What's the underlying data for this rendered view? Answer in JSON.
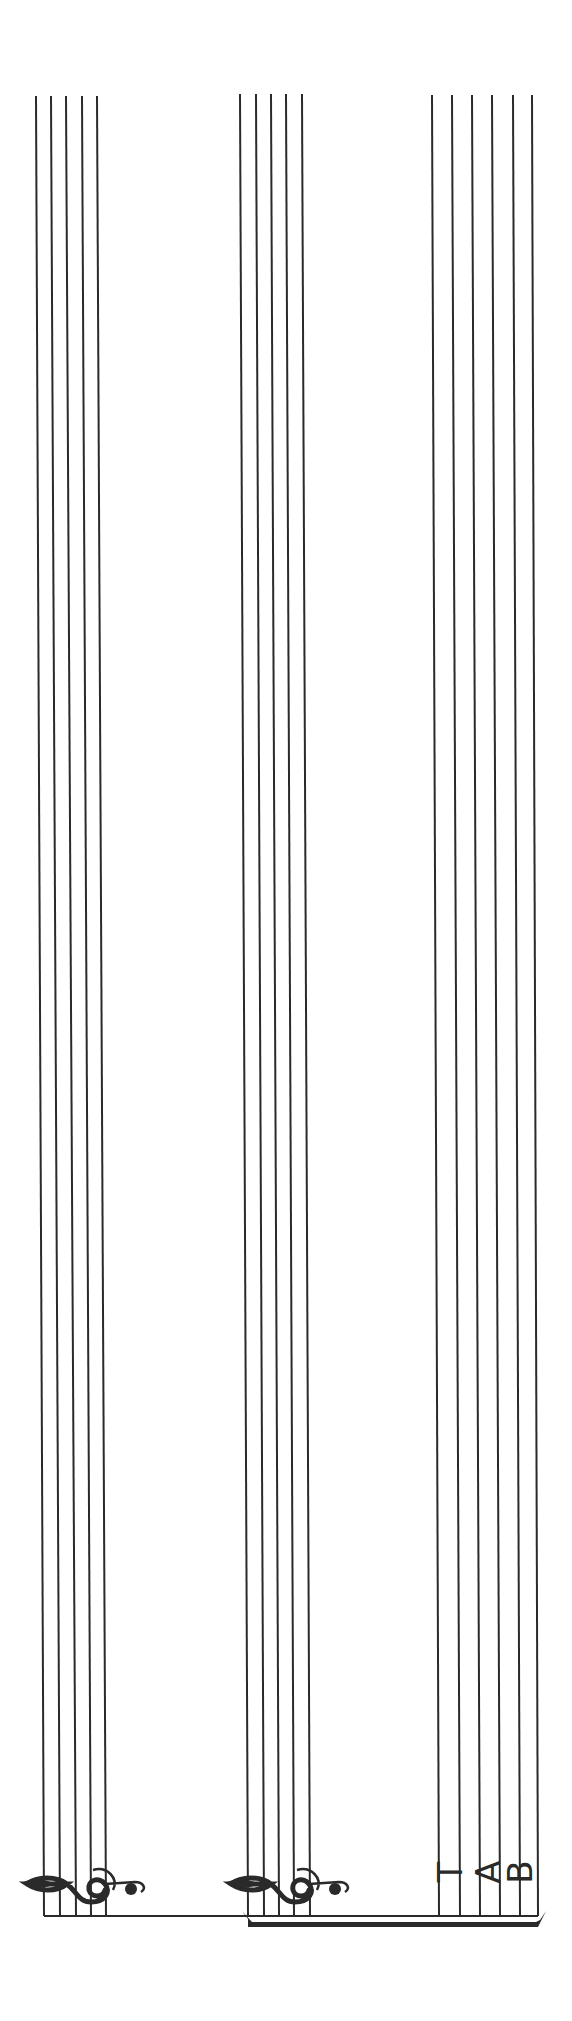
{
  "page": {
    "orientation": "rotated-90",
    "background": "#ffffff",
    "ink_color": "#2a2a2a"
  },
  "staves": [
    {
      "id": "treble-staff-1",
      "clef": "treble",
      "clef_glyph": "𝄞",
      "line_count": 5,
      "top_y": 96,
      "bottom_y": 1916,
      "top_x": [
        36,
        51,
        66,
        82,
        97
      ],
      "bottom_x": [
        44,
        60,
        76,
        91,
        106
      ]
    },
    {
      "id": "treble-staff-2",
      "clef": "treble",
      "clef_glyph": "𝄞",
      "line_count": 5,
      "top_y": 94,
      "bottom_y": 1916,
      "top_x": [
        240,
        256,
        271,
        286,
        302
      ],
      "bottom_x": [
        248,
        264,
        279,
        294,
        310
      ]
    },
    {
      "id": "tab-staff",
      "clef": "tab",
      "clef_letters": [
        "T",
        "A",
        "B"
      ],
      "line_count": 6,
      "top_y": 95,
      "bottom_y": 1916,
      "top_x": [
        432,
        452,
        472,
        492,
        513,
        532
      ],
      "bottom_x": [
        439,
        460,
        480,
        500,
        520,
        538
      ]
    }
  ],
  "system": {
    "barline_y": 1916,
    "barline_x_start": 44,
    "barline_x_end": 538,
    "brace": {
      "x_start": 248,
      "x_end": 538,
      "y": 1925,
      "groups": [
        "treble-staff-2",
        "tab-staff"
      ]
    }
  }
}
